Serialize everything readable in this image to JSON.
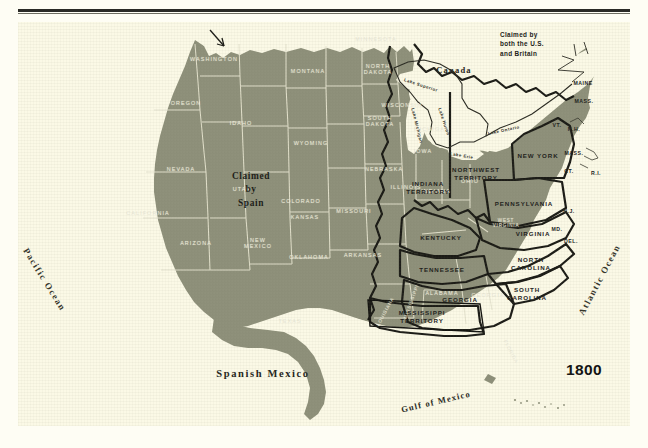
{
  "figure": {
    "year_label": "1800",
    "domain_note": "historical map plate"
  },
  "colors": {
    "paper": "#fbf9e6",
    "land": "#8d8f79",
    "land_light": "#9a9c86",
    "ghost_label": "#e8e6d2",
    "ink": "#22221c",
    "border_heavy": "#1b1b16"
  },
  "geographic": {
    "canada": "Canada",
    "spanish_mexico": "Spanish Mexico",
    "gulf_of_mexico": "Gulf of Mexico",
    "pacific_ocean": "Pacific Ocean",
    "atlantic_ocean": "Atlantic Ocean"
  },
  "lakes": [
    {
      "name": "Lake Superior"
    },
    {
      "name": "Lake Michigan"
    },
    {
      "name": "Lake Huron"
    },
    {
      "name": "Lake Erie"
    },
    {
      "name": "Lake Ontario"
    }
  ],
  "annotations": {
    "claimed_by_both": "Claimed by\nboth the U.S.\nand Britain",
    "claimed_by_both_line1": "Claimed by",
    "claimed_by_both_line2": "both the U.S.",
    "claimed_by_both_line3": "and Britain",
    "claimed_by_spain_line1": "Claimed",
    "claimed_by_spain_line2": "by",
    "claimed_by_spain_line3": "Spain"
  },
  "political_units": [
    {
      "name": "INDIANA\nTERRITORY",
      "line1": "INDIANA",
      "line2": "TERRITORY"
    },
    {
      "name": "NORTHWEST\nTERRITORY",
      "line1": "NORTHWEST",
      "line2": "TERRITORY"
    },
    {
      "name": "MISSISSIPPI\nTERRITORY",
      "line1": "MISSISSIPPI",
      "line2": "TERRITORY"
    },
    {
      "name": "NEW YORK"
    },
    {
      "name": "PENNSYLVANIA"
    },
    {
      "name": "VIRGINIA"
    },
    {
      "name": "KENTUCKY"
    },
    {
      "name": "TENNESSEE"
    },
    {
      "name": "NORTH\nCAROLINA",
      "line1": "NORTH",
      "line2": "CAROLINA"
    },
    {
      "name": "SOUTH\nCAROLINA",
      "line1": "SOUTH",
      "line2": "CAROLINA"
    },
    {
      "name": "GEORGIA"
    },
    {
      "name": "MAINE"
    },
    {
      "name": "MASS."
    },
    {
      "name": "VT."
    },
    {
      "name": "N.H."
    },
    {
      "name": "CT."
    },
    {
      "name": "R.I."
    },
    {
      "name": "N.J."
    },
    {
      "name": "MD."
    },
    {
      "name": "DEL."
    }
  ],
  "modern_states": [
    {
      "name": "WASHINGTON"
    },
    {
      "name": "OREGON"
    },
    {
      "name": "IDAHO"
    },
    {
      "name": "MONTANA"
    },
    {
      "name": "WYOMING"
    },
    {
      "name": "NORTH\nDAKOTA",
      "line1": "NORTH",
      "line2": "DAKOTA"
    },
    {
      "name": "SOUTH\nDAKOTA",
      "line1": "SOUTH",
      "line2": "DAKOTA"
    },
    {
      "name": "NEBRASKA"
    },
    {
      "name": "IOWA"
    },
    {
      "name": "NEVADA"
    },
    {
      "name": "UTAH"
    },
    {
      "name": "COLORADO"
    },
    {
      "name": "CALIFORNIA"
    },
    {
      "name": "ARIZONA"
    },
    {
      "name": "NEW\nMEXICO",
      "line1": "NEW",
      "line2": "MEXICO"
    },
    {
      "name": "KANSAS"
    },
    {
      "name": "OKLAHOMA"
    },
    {
      "name": "TEXAS"
    },
    {
      "name": "MISSOURI"
    },
    {
      "name": "ARKANSAS"
    },
    {
      "name": "MINNESOTA"
    },
    {
      "name": "WISCONSIN"
    },
    {
      "name": "MICHIGAN"
    },
    {
      "name": "ILLINOIS"
    },
    {
      "name": "INDIANA"
    },
    {
      "name": "OHIO"
    },
    {
      "name": "WEST\nVIRGINIA",
      "line1": "WEST",
      "line2": "VIRGINIA"
    },
    {
      "name": "LOUISIANA"
    },
    {
      "name": "MISSISSIPPI"
    },
    {
      "name": "ALABAMA"
    },
    {
      "name": "GEORGIA"
    },
    {
      "name": "FLORIDA"
    }
  ]
}
